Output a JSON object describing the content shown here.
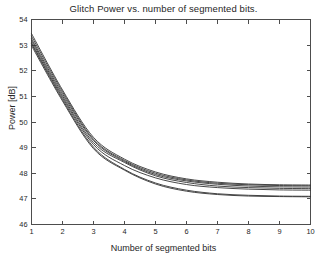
{
  "chart_data": {
    "type": "line",
    "title": "Glitch Power vs. number of segmented bits.",
    "xlabel": "Number of segmented bits",
    "ylabel": "Power [dB]",
    "xlim": [
      1,
      10
    ],
    "ylim": [
      46,
      54
    ],
    "xticks": [
      1,
      2,
      3,
      4,
      5,
      6,
      7,
      8,
      9,
      10
    ],
    "xticklabels": [
      "1",
      "2",
      "3",
      "4",
      "5",
      "6",
      "7",
      "8",
      "9",
      "10"
    ],
    "yticks": [
      46,
      47,
      48,
      49,
      50,
      51,
      52,
      53,
      54
    ],
    "yticklabels": [
      "46",
      "47",
      "48",
      "49",
      "50",
      "51",
      "52",
      "53",
      "54"
    ],
    "grid": false,
    "legend": false,
    "legend_position": "none",
    "line_color": "#333333",
    "background_color": "#ffffff",
    "axis_color": "#4d4d4d",
    "x": [
      1,
      2,
      3,
      4,
      5,
      6,
      7,
      8,
      9,
      10
    ],
    "series": [
      {
        "name": "curve-1",
        "values": [
          53.45,
          51.25,
          49.4,
          48.55,
          48.05,
          47.78,
          47.65,
          47.58,
          47.55,
          47.54
        ]
      },
      {
        "name": "curve-2",
        "values": [
          53.35,
          51.18,
          49.33,
          48.5,
          48.0,
          47.74,
          47.61,
          47.55,
          47.52,
          47.51
        ]
      },
      {
        "name": "curve-3",
        "values": [
          53.25,
          51.1,
          49.28,
          48.46,
          47.95,
          47.7,
          47.57,
          47.5,
          47.47,
          47.46
        ]
      },
      {
        "name": "curve-4",
        "values": [
          53.18,
          51.02,
          49.2,
          48.42,
          47.9,
          47.64,
          47.5,
          47.44,
          47.41,
          47.4
        ]
      },
      {
        "name": "curve-5",
        "values": [
          53.1,
          50.95,
          49.12,
          48.3,
          47.82,
          47.56,
          47.44,
          47.38,
          47.35,
          47.34
        ]
      },
      {
        "name": "curve-6",
        "values": [
          53.05,
          50.88,
          49.02,
          48.15,
          47.62,
          47.34,
          47.2,
          47.14,
          47.11,
          47.1
        ]
      },
      {
        "name": "curve-7",
        "values": [
          52.98,
          50.82,
          48.96,
          48.12,
          47.58,
          47.3,
          47.17,
          47.11,
          47.09,
          47.08
        ]
      }
    ]
  }
}
